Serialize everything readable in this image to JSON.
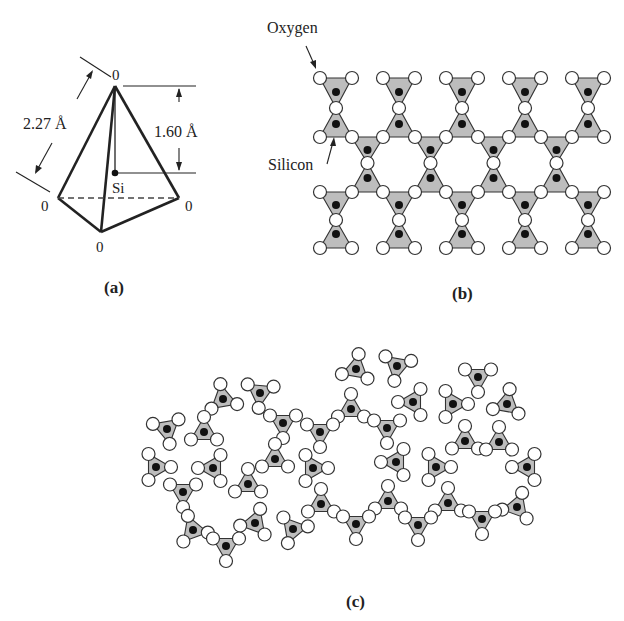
{
  "figure": {
    "panels": [
      {
        "id": "a",
        "label": "(a)",
        "x": 118,
        "y": 293
      },
      {
        "id": "b",
        "label": "(b)",
        "x": 466,
        "y": 299
      },
      {
        "id": "c",
        "label": "(c)",
        "x": 358,
        "y": 607
      }
    ]
  },
  "panel_a": {
    "title": "SiO4 tetrahedron",
    "atom_top": "0",
    "atom_left": "0",
    "atom_right": "0",
    "atom_bottom": "0",
    "center_atom": "Si",
    "edge_length": "2.27 Å",
    "height": "1.60 Å",
    "vertices": {
      "top": [
        115,
        86
      ],
      "left": [
        58,
        198
      ],
      "right": [
        179,
        198
      ],
      "bottom": [
        101,
        232
      ],
      "si": [
        115,
        173
      ]
    }
  },
  "panel_b": {
    "oxygen_label": "Oxygen",
    "silicon_label": "Silicon",
    "columns_x": [
      336,
      399,
      462,
      525,
      588
    ],
    "hex_x": [
      367.5,
      430.5,
      493.5,
      556.5
    ],
    "half_width": 16,
    "rows": {
      "top_o": 78,
      "top_si": 92,
      "top_mid_o": 108,
      "upper_si": 124,
      "upper_o": 137,
      "hex_si_down": 150,
      "hex_mid_o": 163,
      "hex_si_up": 178,
      "lower_o": 192,
      "low_si_down": 205,
      "low_mid_o": 220,
      "low_si_up": 234,
      "bottom_o": 248
    }
  },
  "panel_c": {
    "description": "Irregular silica glass network of SiO4 triangles",
    "triangles": [
      [
        223,
        399,
        -10
      ],
      [
        260,
        393,
        185
      ],
      [
        167,
        429,
        170
      ],
      [
        204,
        432,
        0
      ],
      [
        283,
        423,
        180
      ],
      [
        156,
        467,
        90
      ],
      [
        213,
        468,
        -90
      ],
      [
        275,
        459,
        0
      ],
      [
        183,
        492,
        180
      ],
      [
        248,
        484,
        0
      ],
      [
        193,
        530,
        -20
      ],
      [
        255,
        523,
        20
      ],
      [
        226,
        546,
        180
      ],
      [
        293,
        529,
        200
      ],
      [
        356,
        369,
        10
      ],
      [
        397,
        366,
        190
      ],
      [
        351,
        409,
        0
      ],
      [
        413,
        402,
        -90
      ],
      [
        453,
        404,
        90
      ],
      [
        478,
        377,
        180
      ],
      [
        507,
        404,
        10
      ],
      [
        320,
        432,
        180
      ],
      [
        387,
        428,
        180
      ],
      [
        465,
        441,
        0
      ],
      [
        499,
        442,
        0
      ],
      [
        313,
        468,
        90
      ],
      [
        396,
        462,
        -90
      ],
      [
        436,
        467,
        90
      ],
      [
        527,
        467,
        -90
      ],
      [
        321,
        504,
        0
      ],
      [
        388,
        501,
        0
      ],
      [
        448,
        503,
        0
      ],
      [
        517,
        507,
        20
      ],
      [
        356,
        524,
        180
      ],
      [
        418,
        525,
        180
      ],
      [
        482,
        519,
        180
      ]
    ],
    "tri_radius": 15
  },
  "colors": {
    "triangle_fill": "#bdbdbd",
    "triangle_stroke": "#333333",
    "oxygen_fill": "#ffffff",
    "oxygen_stroke": "#333333",
    "silicon_fill": "#111111",
    "line": "#222222"
  }
}
